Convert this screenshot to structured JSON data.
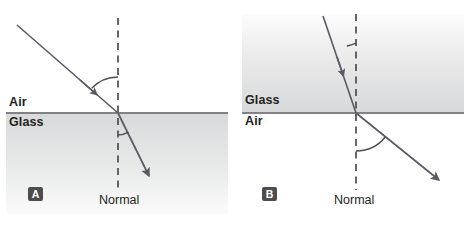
{
  "figure": {
    "type": "physics-diagram",
    "colors": {
      "ray": "#5a5a64",
      "interface_line": "#58585b",
      "normal_dashed": "#4d4d4f",
      "glass_shade_dark": "#d8d9da",
      "glass_shade_light": "#f2f2f3",
      "text": "#231f20",
      "badge_background": "#4d4d4f",
      "badge_text": "#ffffff",
      "background": "#ffffff"
    }
  },
  "panels": [
    {
      "id": "A",
      "badge_label": "A",
      "description": "Light ray travelling from air into glass, bending toward the normal",
      "upper_medium": "Air",
      "lower_medium": "Glass",
      "normal_label": "Normal",
      "shaded_medium": "lower",
      "incident_ray": {
        "from_medium": "Air",
        "to_medium": "Glass",
        "start": [
          17,
          25
        ],
        "end": [
          118,
          113
        ],
        "arrow_at": [
          95,
          93
        ],
        "direction": "down-right"
      },
      "refracted_ray": {
        "start": [
          118,
          113
        ],
        "end": [
          151,
          179
        ],
        "arrow_at": [
          151,
          179
        ],
        "direction": "down-right",
        "bends": "toward-normal"
      },
      "normal_line": {
        "x": 118,
        "top": 18,
        "bottom": 190
      },
      "interface_line": {
        "y": 113,
        "x_start": 6,
        "x_end": 228
      },
      "angle_of_incidence": {
        "arc_radius": 36,
        "value_deg": 49,
        "side": "above-interface"
      },
      "angle_of_refraction": {
        "arc_radius": 22,
        "value_deg": 26,
        "side": "below-interface"
      }
    },
    {
      "id": "B",
      "badge_label": "B",
      "description": "Light ray travelling from glass into air, bending away from the normal",
      "upper_medium": "Glass",
      "lower_medium": "Air",
      "normal_label": "Normal",
      "shaded_medium": "upper",
      "incident_ray": {
        "from_medium": "Glass",
        "to_medium": "Air",
        "start": [
          89,
          16
        ],
        "end": [
          122,
          113
        ],
        "arrow_at": [
          112,
          84
        ],
        "direction": "down-right"
      },
      "refracted_ray": {
        "start": [
          122,
          113
        ],
        "end": [
          208,
          182
        ],
        "arrow_at": [
          208,
          182
        ],
        "direction": "down-right",
        "bends": "away-from-normal"
      },
      "normal_line": {
        "x": 122,
        "top": 14,
        "bottom": 190
      },
      "interface_line": {
        "y": 113,
        "x_start": 8,
        "x_end": 230
      },
      "angle_of_incidence": {
        "arc_radius": 30,
        "value_deg": 19,
        "side": "above-interface"
      },
      "angle_of_refraction": {
        "arc_radius": 38,
        "value_deg": 51,
        "side": "below-interface"
      }
    }
  ]
}
